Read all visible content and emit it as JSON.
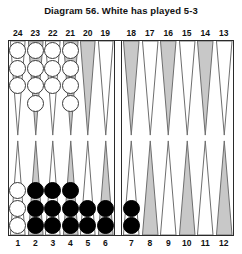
{
  "title": "Diagram 56.  White has played 5-3",
  "colors": {
    "checker_white": "#ffffff",
    "checker_black": "#000000",
    "point_shaded": "#c8c8c8",
    "point_plain": "#ffffff",
    "board_border": "#2a2a2a",
    "text": "#111111"
  },
  "numbers": {
    "top": [
      "24",
      "23",
      "22",
      "21",
      "20",
      "19",
      "18",
      "17",
      "16",
      "15",
      "14",
      "13"
    ],
    "bottom": [
      "1",
      "2",
      "3",
      "4",
      "5",
      "6",
      "7",
      "8",
      "9",
      "10",
      "11",
      "12"
    ]
  },
  "board": {
    "quadrants": {
      "top_left": {
        "points": [
          {
            "number": "24",
            "shaded": false,
            "checkers": 3,
            "color": "white"
          },
          {
            "number": "23",
            "shaded": true,
            "checkers": 4,
            "color": "white"
          },
          {
            "number": "22",
            "shaded": false,
            "checkers": 3,
            "color": "white"
          },
          {
            "number": "21",
            "shaded": true,
            "checkers": 4,
            "color": "white"
          },
          {
            "number": "20",
            "shaded": true,
            "checkers": 0,
            "color": "none"
          },
          {
            "number": "19",
            "shaded": false,
            "checkers": 0,
            "color": "none"
          }
        ]
      },
      "top_right": {
        "points": [
          {
            "number": "18",
            "shaded": true,
            "checkers": 0,
            "color": "none"
          },
          {
            "number": "17",
            "shaded": false,
            "checkers": 0,
            "color": "none"
          },
          {
            "number": "16",
            "shaded": true,
            "checkers": 0,
            "color": "none"
          },
          {
            "number": "15",
            "shaded": false,
            "checkers": 0,
            "color": "none"
          },
          {
            "number": "14",
            "shaded": true,
            "checkers": 0,
            "color": "none"
          },
          {
            "number": "13",
            "shaded": false,
            "checkers": 0,
            "color": "none"
          }
        ]
      },
      "bottom_left": {
        "points": [
          {
            "number": "1",
            "shaded": false,
            "checkers": 3,
            "color": "white"
          },
          {
            "number": "2",
            "shaded": true,
            "checkers": 3,
            "color": "black"
          },
          {
            "number": "3",
            "shaded": false,
            "checkers": 3,
            "color": "black"
          },
          {
            "number": "4",
            "shaded": true,
            "checkers": 3,
            "color": "black"
          },
          {
            "number": "5",
            "shaded": false,
            "checkers": 2,
            "color": "black"
          },
          {
            "number": "6",
            "shaded": true,
            "checkers": 2,
            "color": "black"
          }
        ]
      },
      "bottom_right": {
        "points": [
          {
            "number": "7",
            "shaded": false,
            "checkers": 2,
            "color": "black"
          },
          {
            "number": "8",
            "shaded": true,
            "checkers": 0,
            "color": "none"
          },
          {
            "number": "9",
            "shaded": false,
            "checkers": 0,
            "color": "none"
          },
          {
            "number": "10",
            "shaded": true,
            "checkers": 0,
            "color": "none"
          },
          {
            "number": "11",
            "shaded": false,
            "checkers": 0,
            "color": "none"
          },
          {
            "number": "12",
            "shaded": true,
            "checkers": 0,
            "color": "none"
          }
        ]
      }
    },
    "bar": {
      "white_checkers": 0,
      "black_checkers": 0
    }
  }
}
